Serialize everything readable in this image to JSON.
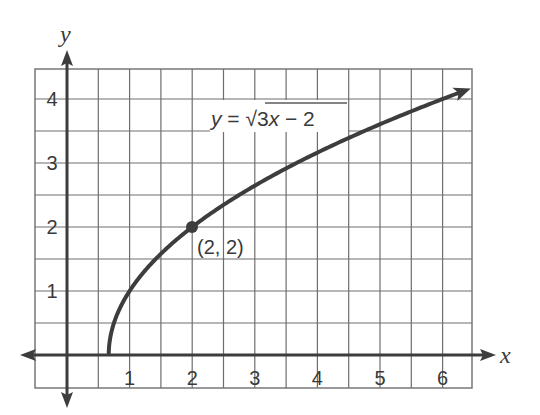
{
  "chart_data": {
    "type": "line",
    "title": "",
    "function": "y = sqrt(3x - 2)",
    "xlabel": "x",
    "ylabel": "y",
    "xlim": [
      -1.0,
      6.5
    ],
    "ylim": [
      -0.5,
      4.5
    ],
    "grid": true,
    "grid_step": 0.5,
    "x_ticks": [
      1,
      2,
      3,
      4,
      5,
      6
    ],
    "y_ticks": [
      1,
      2,
      3,
      4
    ],
    "x_tick_labels": [
      "1",
      "2",
      "3",
      "4",
      "5",
      "6"
    ],
    "y_tick_labels": [
      "1",
      "2",
      "3",
      "4"
    ],
    "series": [
      {
        "name": "y = √3x − 2",
        "x": [
          0.667,
          0.75,
          1,
          1.5,
          2,
          2.5,
          3,
          3.5,
          4,
          4.5,
          5,
          5.5,
          6,
          6.45
        ],
        "y": [
          0,
          0.5,
          1,
          1.58,
          2,
          2.35,
          2.65,
          2.92,
          3.16,
          3.39,
          3.61,
          3.81,
          4,
          4.15
        ],
        "color": "#3d3d3d",
        "endpoint_arrow": true
      }
    ],
    "annotations": [
      {
        "type": "point",
        "x": 2,
        "y": 2,
        "label": "(2, 2)"
      },
      {
        "type": "equation-label",
        "text": "y = √3x − 2",
        "position": [
          3.1,
          3.6
        ]
      }
    ],
    "legend": "none"
  },
  "labels": {
    "x_axis": "x",
    "y_axis": "y",
    "eq_y": "y",
    "eq_equals": " = ",
    "eq_sqrt": "√",
    "eq_radicand_num": "3",
    "eq_radicand_var": "x",
    "eq_radicand_rest": " − 2",
    "point_label": "(2, 2)",
    "x_ticks": [
      "1",
      "2",
      "3",
      "4",
      "5",
      "6"
    ],
    "y_ticks": [
      "1",
      "2",
      "3",
      "4"
    ]
  },
  "colors": {
    "grid": "#6e6e6e",
    "axis": "#3d3d3d",
    "curve": "#3d3d3d",
    "text": "#3a3a3a"
  }
}
